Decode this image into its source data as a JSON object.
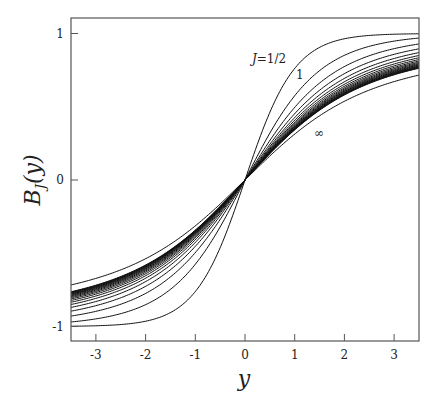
{
  "chart_data": {
    "type": "line",
    "title": "",
    "xlabel": "y",
    "ylabel": "B_J(y)",
    "ylabel_main": "B",
    "ylabel_sub": "J",
    "ylabel_tail": "(y)",
    "xlim": [
      -3.5,
      3.5
    ],
    "ylim": [
      -1.1,
      1.1
    ],
    "grid": false,
    "x_ticks": [
      -3,
      -2,
      -1,
      0,
      1,
      2,
      3
    ],
    "x_tick_labels": [
      "-3",
      "-2",
      "-1",
      "0",
      "1",
      "2",
      "3"
    ],
    "y_ticks": [
      -1,
      0,
      1
    ],
    "y_tick_labels": [
      "-1",
      "0",
      "1"
    ],
    "function": "Brillouin function B_J(y) = ((2J+1)/(2J)) coth((2J+1)y/(2J)) - (1/(2J)) coth(y/(2J)); J=infinity gives Langevin coth(y)-1/y",
    "series_J": [
      0.5,
      1,
      1.5,
      2,
      2.5,
      3,
      3.5,
      4,
      4.5,
      5,
      5.5,
      6,
      6.5,
      7,
      7.5,
      8,
      8.5,
      9,
      9.5,
      10,
      "inf"
    ],
    "annotations": [
      {
        "text": "J=1/2",
        "italic_prefix": "J",
        "rest": "=1/2",
        "refers_to": 0.5
      },
      {
        "text": "1",
        "refers_to": 1
      },
      {
        "text": "∞",
        "refers_to": "inf"
      }
    ]
  }
}
